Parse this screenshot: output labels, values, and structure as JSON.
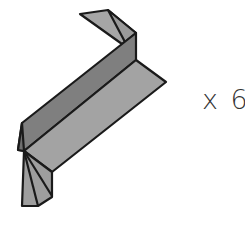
{
  "diagram": {
    "part": "folded-bracket",
    "quantity_label": "x 6",
    "colors": {
      "face_light": "#a6a6a6",
      "face_mid": "#8f8f8f",
      "face_dark": "#7a7a7a",
      "outline": "#1a1a1a",
      "text": "#333333"
    }
  }
}
